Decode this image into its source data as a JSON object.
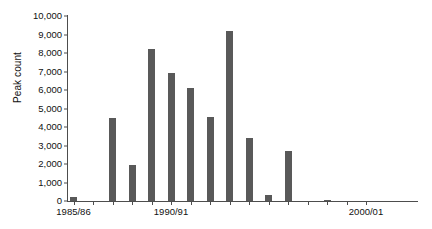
{
  "chart_data": {
    "type": "bar",
    "title": "",
    "xlabel": "",
    "ylabel": "Peak count",
    "ylim": [
      0,
      10000
    ],
    "ytick_labels": [
      "0",
      "1,000",
      "2,000",
      "3,000",
      "4,000",
      "5,000",
      "6,000",
      "7,000",
      "8,000",
      "9,000",
      "10,000"
    ],
    "ytick_values": [
      0,
      1000,
      2000,
      3000,
      4000,
      5000,
      6000,
      7000,
      8000,
      9000,
      10000
    ],
    "grid": false,
    "legend": "none",
    "bar_color": "#595959",
    "axis_color": "#4d4d4d",
    "categories": [
      "1985/86",
      "1986/87",
      "1987/88",
      "1988/89",
      "1989/90",
      "1990/91",
      "1991/92",
      "1992/93",
      "1993/94",
      "1994/95",
      "1995/96",
      "1996/97",
      "1997/98",
      "1998/99",
      "1999/00",
      "2000/01"
    ],
    "values": [
      200,
      0,
      4500,
      1950,
      8200,
      6900,
      6100,
      4550,
      9200,
      3400,
      350,
      2700,
      0,
      50,
      0,
      0
    ],
    "xtick_labels_shown": [
      "1985/86",
      "1990/91",
      "2000/01"
    ],
    "xtick_label_indices": [
      0,
      5,
      15
    ]
  }
}
